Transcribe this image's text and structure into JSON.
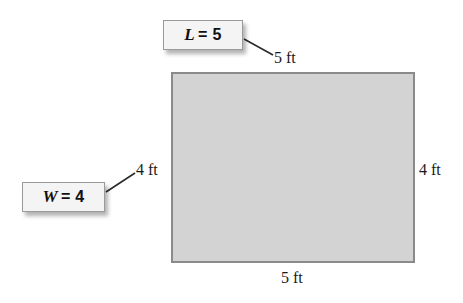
{
  "figure": {
    "shape": "rectangle",
    "fill_color": "#d3d3d3",
    "border_color": "#8a8a8a",
    "background_color": "#ffffff"
  },
  "dimensions": {
    "top_label": "5 ft",
    "bottom_label": "5 ft",
    "left_label": "4 ft",
    "right_label": "4 ft"
  },
  "callouts": {
    "length": {
      "variable": "L",
      "expression": "= 5"
    },
    "width": {
      "variable": "W",
      "expression": "= 4"
    }
  }
}
